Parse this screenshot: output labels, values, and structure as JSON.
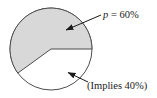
{
  "chart_data": {
    "type": "pie",
    "title": "",
    "slices": [
      {
        "label": "p = 60%",
        "value": 60,
        "color": "#d8d8d8"
      },
      {
        "label": "(Implies 40%)",
        "value": 40,
        "color": "#ffffff"
      }
    ],
    "start_angle_deg": 0,
    "direction": "counterclockwise",
    "legend": "none",
    "annotations": [
      {
        "text": "p = 60%",
        "points_to": "shaded 60% slice"
      },
      {
        "text": "(Implies 40%)",
        "points_to": "white 40% slice"
      }
    ]
  },
  "labels": {
    "p_var": "p",
    "p_rest": " = 60%",
    "implies_label": "(Implies 40%)"
  },
  "colors": {
    "shaded_slice": "#d8d8d8",
    "white_slice": "#ffffff",
    "outline": "#4d4d4d",
    "arrow": "#1a1a1a",
    "text": "#1a1a1a",
    "background": "#ffffff"
  }
}
